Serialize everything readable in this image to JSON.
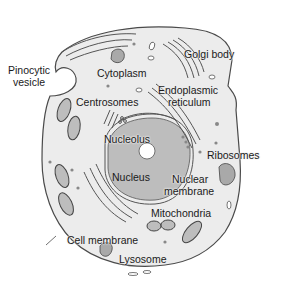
{
  "diagram": {
    "colors": {
      "cytoplasm": "#ececec",
      "membrane": "#4a4a4a",
      "nucleus": "#bdbdbd",
      "nucleolus": "#ffffff",
      "organelle_dark": "#a9a9a9",
      "background": "#ffffff",
      "label": "#1a1a1a"
    },
    "labels": {
      "pinocytic_vesicle": {
        "line1": "Pinocytic",
        "line2": "vesicle"
      },
      "cytoplasm": "Cytoplasm",
      "golgi_body": "Golgi body",
      "endoplasmic_reticulum": {
        "line1": "Endoplasmic",
        "line2": "reticulum"
      },
      "centrosomes": "Centrosomes",
      "nucleolus": "Nucleolus",
      "ribosomes": "Ribosomes",
      "nucleus": "Nucleus",
      "nuclear_membrane": {
        "line1": "Nuclear",
        "line2": "membrane"
      },
      "mitochondria": "Mitochondria",
      "cell_membrane": "Cell membrane",
      "lysosome": "Lysosome"
    }
  }
}
